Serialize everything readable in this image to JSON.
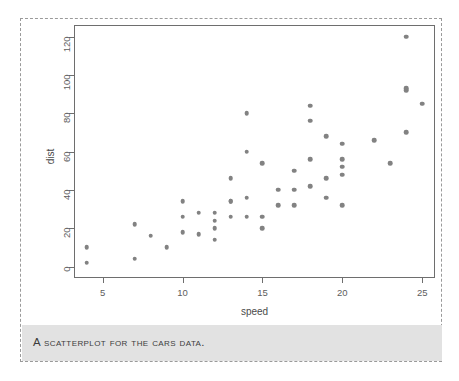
{
  "figure": {
    "caption": "A scatterplot for the cars data.",
    "border_color": "#9a9a9a",
    "caption_band_color": "#e2e2e2"
  },
  "chart_data": {
    "type": "scatter",
    "title": "",
    "xlabel": "speed",
    "ylabel": "dist",
    "xlim": [
      3.2,
      25.8
    ],
    "ylim": [
      -6,
      126
    ],
    "xticks": [
      5,
      10,
      15,
      20,
      25
    ],
    "yticks": [
      0,
      20,
      40,
      60,
      80,
      100,
      120
    ],
    "grid": false,
    "legend": null,
    "point_color": "#828282",
    "marker": "filled-circle",
    "series": [
      {
        "name": "cars",
        "x": [
          4,
          4,
          7,
          7,
          8,
          9,
          10,
          10,
          10,
          11,
          11,
          12,
          12,
          12,
          12,
          13,
          13,
          13,
          13,
          14,
          14,
          14,
          14,
          15,
          15,
          15,
          16,
          16,
          17,
          17,
          17,
          18,
          18,
          18,
          18,
          19,
          19,
          19,
          20,
          20,
          20,
          20,
          20,
          22,
          23,
          24,
          24,
          24,
          24,
          25
        ],
        "y": [
          2,
          10,
          4,
          22,
          16,
          10,
          18,
          26,
          34,
          17,
          28,
          14,
          20,
          24,
          28,
          26,
          34,
          34,
          46,
          26,
          36,
          60,
          80,
          20,
          26,
          54,
          32,
          40,
          32,
          40,
          50,
          42,
          56,
          76,
          84,
          36,
          46,
          68,
          32,
          48,
          52,
          56,
          64,
          66,
          54,
          70,
          92,
          93,
          120,
          85
        ]
      }
    ]
  }
}
